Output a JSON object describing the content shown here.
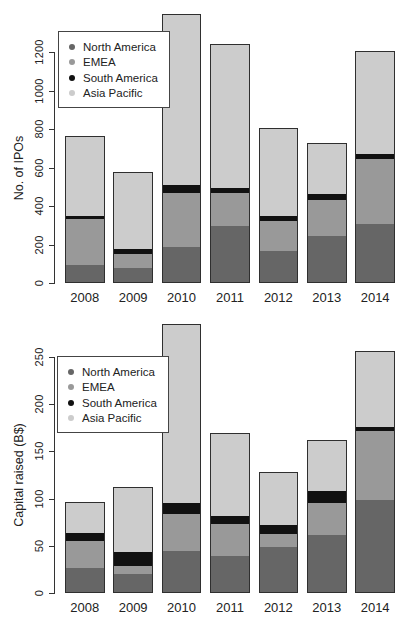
{
  "styles": {
    "background": "#ffffff",
    "bar_border": "#2f2f2f",
    "axis_color": "#333333",
    "text_color": "#222222",
    "legend_border": "#444444"
  },
  "chart_data": [
    {
      "type": "bar",
      "stacked": true,
      "title": "",
      "xlabel": "",
      "ylabel": "No. of IPOs",
      "categories": [
        "2008",
        "2009",
        "2010",
        "2011",
        "2012",
        "2013",
        "2014"
      ],
      "series": [
        {
          "name": "North America",
          "color": "#666666",
          "values": [
            95,
            80,
            185,
            295,
            165,
            245,
            305
          ]
        },
        {
          "name": "EMEA",
          "color": "#999999",
          "values": [
            235,
            70,
            280,
            170,
            155,
            185,
            340
          ]
        },
        {
          "name": "South America",
          "color": "#111111",
          "values": [
            20,
            25,
            45,
            30,
            30,
            35,
            25
          ]
        },
        {
          "name": "Asia Pacific",
          "color": "#cccccc",
          "values": [
            415,
            400,
            885,
            745,
            455,
            260,
            535
          ]
        }
      ],
      "totals": [
        765,
        575,
        1395,
        1240,
        805,
        725,
        1205
      ],
      "yticks": [
        0,
        200,
        400,
        600,
        800,
        1000,
        1200
      ],
      "ylim": [
        0,
        1400
      ],
      "grid": false,
      "legend": {
        "position": "top-left",
        "entries": [
          "North America",
          "EMEA",
          "South America",
          "Asia Pacific"
        ]
      }
    },
    {
      "type": "bar",
      "stacked": true,
      "title": "",
      "xlabel": "",
      "ylabel": "Capital raised (B$)",
      "categories": [
        "2008",
        "2009",
        "2010",
        "2011",
        "2012",
        "2013",
        "2014"
      ],
      "series": [
        {
          "name": "North America",
          "color": "#666666",
          "values": [
            27,
            20,
            44,
            39,
            49,
            61,
            98
          ]
        },
        {
          "name": "EMEA",
          "color": "#999999",
          "values": [
            28,
            9,
            40,
            34,
            14,
            34,
            74
          ]
        },
        {
          "name": "South America",
          "color": "#111111",
          "values": [
            9,
            14,
            11,
            9,
            9,
            13,
            4
          ]
        },
        {
          "name": "Asia Pacific",
          "color": "#cccccc",
          "values": [
            32,
            69,
            190,
            88,
            56,
            54,
            80
          ]
        }
      ],
      "totals": [
        96,
        112,
        285,
        170,
        128,
        162,
        256
      ],
      "yticks": [
        0,
        50,
        100,
        150,
        200,
        250
      ],
      "ylim": [
        0,
        290
      ],
      "grid": false,
      "legend": {
        "position": "top-left",
        "entries": [
          "North America",
          "EMEA",
          "South America",
          "Asia Pacific"
        ]
      }
    }
  ]
}
